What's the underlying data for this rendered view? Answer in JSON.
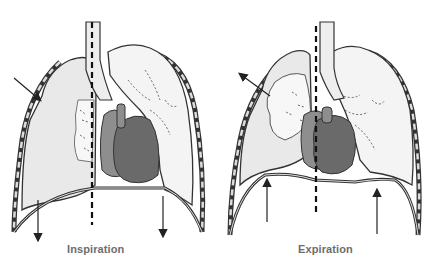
{
  "diagram": {
    "panels": [
      {
        "id": "inspiration",
        "label": "Inspiration"
      },
      {
        "id": "expiration",
        "label": "Expiration"
      }
    ],
    "colors": {
      "lung_fill": "#e9e9e9",
      "lung_inner": "#f6f6f6",
      "heart_light": "#8e8e8e",
      "heart_dark": "#6a6a6a",
      "outline": "#333333",
      "label": "#6d6d6d",
      "rib": "#555555"
    }
  }
}
